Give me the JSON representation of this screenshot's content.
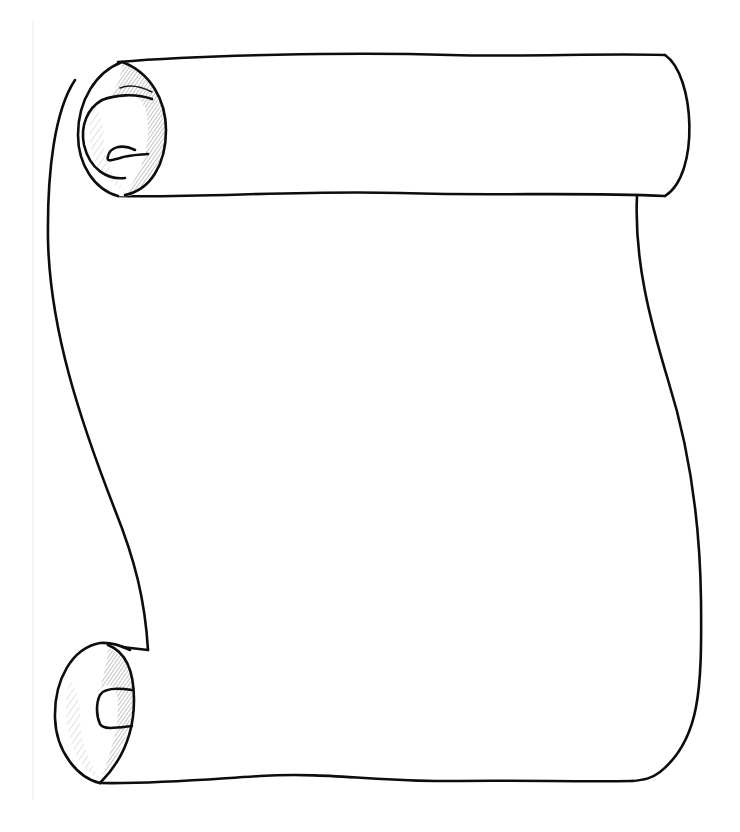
{
  "image": {
    "title": "Blank parchment scroll illustration",
    "description": "Hand-drawn black line art of an unrolled paper scroll with curled ends at top-left and bottom-left, blank writing area in the middle",
    "background_color": "#ffffff",
    "ink_color": "#0d0d0d",
    "shading_color": "#555555"
  },
  "scroll": {
    "top_roll": {
      "position": "top",
      "curl_side": "left",
      "shaded": true
    },
    "bottom_roll": {
      "position": "bottom",
      "curl_side": "left",
      "shaded": true
    },
    "body": {
      "content": ""
    }
  }
}
